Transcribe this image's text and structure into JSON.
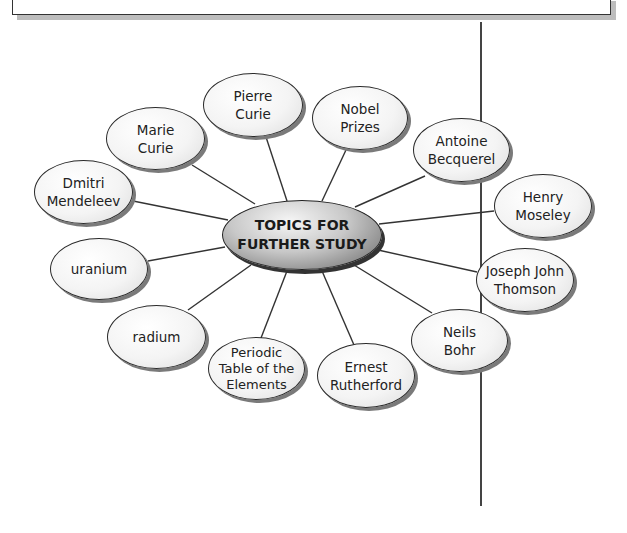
{
  "diagram": {
    "type": "concept-web",
    "center": {
      "label": "TOPICS FOR\nFURTHER STUDY"
    },
    "nodes": [
      {
        "id": "pierre-curie",
        "label": "Pierre\nCurie"
      },
      {
        "id": "nobel-prizes",
        "label": "Nobel\nPrizes"
      },
      {
        "id": "antoine-becquerel",
        "label": "Antoine\nBecquerel"
      },
      {
        "id": "henry-moseley",
        "label": "Henry\nMoseley"
      },
      {
        "id": "joseph-john-thomson",
        "label": "Joseph John\nThomson"
      },
      {
        "id": "neils-bohr",
        "label": "Neils\nBohr"
      },
      {
        "id": "ernest-rutherford",
        "label": "Ernest\nRutherford"
      },
      {
        "id": "periodic-table",
        "label": "Periodic\nTable of the\nElements"
      },
      {
        "id": "radium",
        "label": "radium"
      },
      {
        "id": "uranium",
        "label": "uranium"
      },
      {
        "id": "dmitri-mendeleev",
        "label": "Dmitri\nMendeleev"
      },
      {
        "id": "marie-curie",
        "label": "Marie\nCurie"
      }
    ]
  },
  "colors": {
    "line": "#333333",
    "node_fill": "#f4f4f4",
    "center_dark": "#5e5e5e",
    "shadow": "#7a7a7a"
  }
}
